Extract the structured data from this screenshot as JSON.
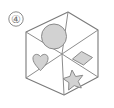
{
  "figure": {
    "name": "isometric-cube-puzzle-option",
    "canvas": {
      "width": 114,
      "height": 108,
      "background": "#ffffff"
    },
    "option_label": {
      "text": "④",
      "plain_text": "4",
      "style": "circled-digit",
      "color": "#6f6f6f",
      "x": 16,
      "y": 19
    },
    "cube": {
      "type": "hexagon-isometric-cube",
      "outline_color": "#7a7a7a",
      "inner_line_color": "#8d8d8d",
      "fill": "#ffffff",
      "stroke_width": 1,
      "vertices": [
        {
          "name": "top",
          "x": 68,
          "y": 12
        },
        {
          "name": "upper-right",
          "x": 98,
          "y": 30
        },
        {
          "name": "lower-right",
          "x": 98,
          "y": 77
        },
        {
          "name": "bottom",
          "x": 64,
          "y": 95
        },
        {
          "name": "lower-left",
          "x": 26,
          "y": 78
        },
        {
          "name": "upper-left",
          "x": 26,
          "y": 32
        }
      ],
      "center": {
        "x": 62,
        "y": 54
      },
      "inner_edges": [
        {
          "name": "center-to-top",
          "to": "top"
        },
        {
          "name": "center-to-upper-left",
          "to": "upper-left"
        },
        {
          "name": "center-to-lower-right",
          "to": "lower-right"
        }
      ]
    },
    "faces": [
      {
        "id": "top-face",
        "position": "top",
        "shape": "circle",
        "shape_label": "circle",
        "empty": false,
        "fill": "#d2d2d2",
        "stroke": "#8a8a8a"
      },
      {
        "id": "left-face-upper",
        "position": "left-upper",
        "shape": "heart",
        "shape_label": "heart",
        "empty": false,
        "fill": "#d2d2d2",
        "stroke": "#8a8a8a"
      },
      {
        "id": "right-face-upper",
        "position": "right-upper",
        "shape": "diamond",
        "shape_label": "diamond",
        "empty": false,
        "fill": "#d2d2d2",
        "stroke": "#8a8a8a"
      },
      {
        "id": "right-face-lower",
        "position": "right-lower",
        "shape": "star",
        "shape_label": "five-pointed star",
        "empty": false,
        "fill": "#d2d2d2",
        "stroke": "#8a8a8a"
      },
      {
        "id": "left-face-lower",
        "position": "left-lower",
        "shape": "none",
        "shape_label": "empty",
        "empty": true,
        "fill": "none",
        "stroke": "none"
      }
    ]
  }
}
